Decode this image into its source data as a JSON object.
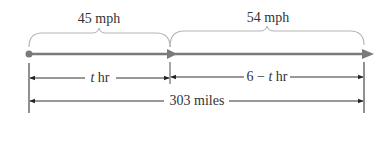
{
  "diagram": {
    "speeds": [
      {
        "label": "45 mph"
      },
      {
        "label": "54 mph"
      }
    ],
    "segments": [
      {
        "var": "t",
        "unit": " hr"
      },
      {
        "prefix": "6 − ",
        "var": "t",
        "unit": " hr"
      }
    ],
    "total": {
      "label": "303 miles"
    },
    "colors": {
      "main_arrow": "#7a7a7a",
      "brace": "#b0b0b0",
      "dimension_line": "#333333",
      "text": "#333333"
    }
  }
}
